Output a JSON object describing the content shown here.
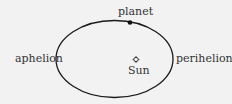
{
  "labels": {
    "planet": "planet",
    "aphelion": "aphelion",
    "perihelion": "perihelion",
    "sun": "Sun"
  },
  "colors": {
    "background": "#f2f2f2",
    "line": "#1a1a1a",
    "text": "#333333"
  }
}
